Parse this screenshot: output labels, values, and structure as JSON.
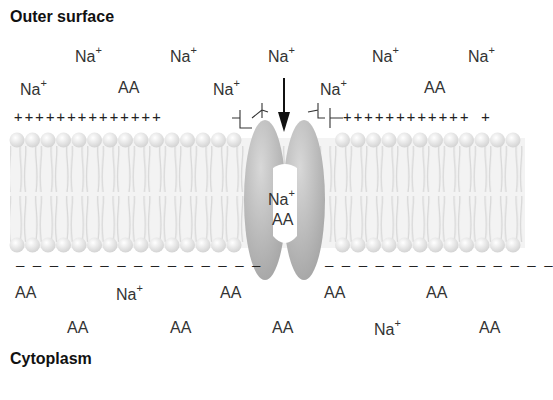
{
  "labels": {
    "outer_surface": "Outer surface",
    "cytoplasm": "Cytoplasm"
  },
  "ions": {
    "na": "Na",
    "na_charge": "+",
    "aa": "AA"
  },
  "charges": {
    "outer_left": "++++++++++++++",
    "outer_right": "++++++++++++ +",
    "inner_left": "– – – – – – – – – – – – – – –",
    "inner_right": "– – – – – – – – – – – – – –"
  },
  "outer_particles": [
    {
      "type": "Na+",
      "x": 75,
      "y": 47
    },
    {
      "type": "Na+",
      "x": 170,
      "y": 47
    },
    {
      "type": "Na+",
      "x": 268,
      "y": 47
    },
    {
      "type": "Na+",
      "x": 372,
      "y": 47
    },
    {
      "type": "Na+",
      "x": 468,
      "y": 47
    },
    {
      "type": "Na+",
      "x": 20,
      "y": 80
    },
    {
      "type": "AA",
      "x": 118,
      "y": 80
    },
    {
      "type": "Na+",
      "x": 213,
      "y": 80
    },
    {
      "type": "Na+",
      "x": 320,
      "y": 80
    },
    {
      "type": "AA",
      "x": 424,
      "y": 80
    }
  ],
  "transporter_cargo": [
    {
      "type": "Na+",
      "x": 268,
      "y": 190
    },
    {
      "type": "AA",
      "x": 272,
      "y": 212
    }
  ],
  "inner_particles": [
    {
      "type": "AA",
      "x": 15,
      "y": 285
    },
    {
      "type": "Na+",
      "x": 116,
      "y": 285
    },
    {
      "type": "AA",
      "x": 220,
      "y": 285
    },
    {
      "type": "AA",
      "x": 324,
      "y": 285
    },
    {
      "type": "AA",
      "x": 426,
      "y": 285
    },
    {
      "type": "AA",
      "x": 67,
      "y": 320
    },
    {
      "type": "AA",
      "x": 170,
      "y": 320
    },
    {
      "type": "AA",
      "x": 272,
      "y": 320
    },
    {
      "type": "Na+",
      "x": 374,
      "y": 320
    },
    {
      "type": "AA",
      "x": 479,
      "y": 320
    }
  ],
  "colors": {
    "protein": "#b3b3b3",
    "lipid_head": "#e6e6e6",
    "lipid_tail": "#cfcfcf",
    "text": "#333333"
  }
}
